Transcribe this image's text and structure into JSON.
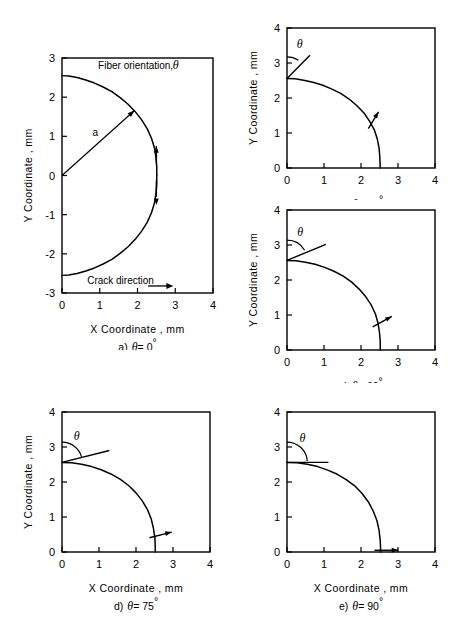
{
  "figure": {
    "kind": "multi-panel-line-chart",
    "background": "#ffffff",
    "line_color": "#000000",
    "panel_count": 5
  },
  "labels": {
    "x_axis": "X Coordinate , mm",
    "y_axis": "Y Coordinate , mm",
    "fiber_orientation": "Fiber orientation,",
    "crack_direction": "Crack direction",
    "radius_symbol": "a",
    "theta_symbol": "θ",
    "degree_symbol": "°"
  },
  "chart_data": [
    {
      "id": "panel-a",
      "type": "line",
      "title": "a) θ = 0°",
      "caption_prefix": "a)",
      "caption_theta": "θ = 0",
      "theta_deg": 0,
      "xlabel": "X Coordinate , mm",
      "ylabel": "Y Coordinate , mm",
      "xlim": [
        0,
        4
      ],
      "ylim": [
        -3,
        3
      ],
      "xticks": [
        0,
        1,
        2,
        3,
        4
      ],
      "xticklabels": [
        "0",
        "1",
        "2",
        "3",
        "4"
      ],
      "yticks": [
        -3,
        -2,
        -1,
        0,
        1,
        2,
        3
      ],
      "yticklabels": [
        "-3",
        "-2",
        "-1",
        "0",
        "1",
        "2",
        "3"
      ],
      "grid": false,
      "legend": false,
      "series": [
        {
          "name": "crack-front-upper",
          "points": [
            [
              0.0,
              2.55
            ],
            [
              0.18,
              2.54
            ],
            [
              0.4,
              2.5
            ],
            [
              0.63,
              2.44
            ],
            [
              0.86,
              2.36
            ],
            [
              1.09,
              2.26
            ],
            [
              1.32,
              2.14
            ],
            [
              1.54,
              1.99
            ],
            [
              1.75,
              1.82
            ],
            [
              1.94,
              1.63
            ],
            [
              2.11,
              1.42
            ],
            [
              2.26,
              1.19
            ],
            [
              2.37,
              0.95
            ],
            [
              2.45,
              0.7
            ],
            [
              2.49,
              0.45
            ],
            [
              2.51,
              0.22
            ],
            [
              2.51,
              0.0
            ]
          ]
        },
        {
          "name": "crack-front-lower",
          "points": [
            [
              2.51,
              0.0
            ],
            [
              2.51,
              -0.22
            ],
            [
              2.49,
              -0.45
            ],
            [
              2.45,
              -0.7
            ],
            [
              2.37,
              -0.95
            ],
            [
              2.26,
              -1.19
            ],
            [
              2.11,
              -1.42
            ],
            [
              1.94,
              -1.63
            ],
            [
              1.75,
              -1.82
            ],
            [
              1.54,
              -1.99
            ],
            [
              1.32,
              -2.14
            ],
            [
              1.09,
              -2.26
            ],
            [
              0.86,
              -2.36
            ],
            [
              0.63,
              -2.44
            ],
            [
              0.4,
              -2.5
            ],
            [
              0.18,
              -2.54
            ],
            [
              0.0,
              -2.55
            ]
          ]
        }
      ],
      "annotations": {
        "title_text": "Fiber orientation,",
        "title_theta": "θ",
        "title_at": [
          1.95,
          2.72
        ],
        "radius_arrow": {
          "from": [
            0.0,
            0.0
          ],
          "to": [
            1.92,
            1.66
          ],
          "label": "a",
          "label_at": [
            0.88,
            1.02
          ]
        },
        "crack_dir_text": "Crack direction",
        "crack_dir_at": [
          1.55,
          -2.78
        ],
        "crack_dir_arrow": {
          "from": [
            2.28,
            -2.82
          ],
          "to": [
            2.95,
            -2.82
          ]
        },
        "fiber_ticks": [
          {
            "at": [
              2.5,
              0.44
            ],
            "angle_deg": 0,
            "length": 0.62,
            "arrow": "up"
          },
          {
            "at": [
              2.5,
              -0.44
            ],
            "angle_deg": 0,
            "length": 0.62,
            "arrow": "down"
          }
        ]
      }
    },
    {
      "id": "panel-b",
      "type": "line",
      "title": "b) θ = 30°",
      "caption_prefix": "b)",
      "caption_theta": "θ = 30",
      "theta_deg": 30,
      "xlabel": "",
      "ylabel": "Y Coordinate , mm",
      "xlim": [
        0,
        4
      ],
      "ylim": [
        0,
        4
      ],
      "xticks": [
        0,
        1,
        2,
        3,
        4
      ],
      "xticklabels": [
        "0",
        "1",
        "2",
        "3",
        "4"
      ],
      "yticks": [
        0,
        1,
        2,
        3,
        4
      ],
      "yticklabels": [
        "0",
        "1",
        "2",
        "3",
        "4"
      ],
      "grid": false,
      "legend": false,
      "series": [
        {
          "name": "crack-front",
          "points": [
            [
              0.0,
              2.56
            ],
            [
              0.22,
              2.55
            ],
            [
              0.45,
              2.51
            ],
            [
              0.7,
              2.45
            ],
            [
              0.95,
              2.37
            ],
            [
              1.2,
              2.26
            ],
            [
              1.45,
              2.13
            ],
            [
              1.68,
              1.97
            ],
            [
              1.89,
              1.78
            ],
            [
              2.08,
              1.57
            ],
            [
              2.23,
              1.34
            ],
            [
              2.36,
              1.09
            ],
            [
              2.44,
              0.83
            ],
            [
              2.49,
              0.56
            ],
            [
              2.51,
              0.28
            ],
            [
              2.52,
              0.0
            ]
          ]
        }
      ],
      "annotations": {
        "theta_label": "θ",
        "theta_label_at": [
          0.34,
          3.42
        ],
        "theta_arc": {
          "center": [
            0.0,
            2.56
          ],
          "radius": 0.58,
          "start_deg": 90,
          "end_deg": 58
        },
        "theta_ray": {
          "from": [
            0.0,
            2.56
          ],
          "to": [
            0.62,
            3.22
          ]
        },
        "fiber_ticks": [
          {
            "at": [
              2.27,
              1.25
            ],
            "angle_deg": 30,
            "length": 0.82,
            "arrow": "tip"
          }
        ]
      }
    },
    {
      "id": "panel-c",
      "type": "line",
      "title": "c) θ = 60°",
      "caption_prefix": "c)",
      "caption_theta": "θ = 60",
      "theta_deg": 60,
      "xlabel": "",
      "ylabel": "Y Coordinate , mm",
      "xlim": [
        0,
        4
      ],
      "ylim": [
        0,
        4
      ],
      "xticks": [
        0,
        1,
        2,
        3,
        4
      ],
      "xticklabels": [
        "0",
        "1",
        "2",
        "3",
        "4"
      ],
      "yticks": [
        0,
        1,
        2,
        3,
        4
      ],
      "yticklabels": [
        "0",
        "1",
        "2",
        "3",
        "4"
      ],
      "grid": false,
      "legend": false,
      "series": [
        {
          "name": "crack-front",
          "points": [
            [
              0.0,
              2.56
            ],
            [
              0.24,
              2.55
            ],
            [
              0.5,
              2.51
            ],
            [
              0.76,
              2.45
            ],
            [
              1.02,
              2.36
            ],
            [
              1.27,
              2.25
            ],
            [
              1.52,
              2.11
            ],
            [
              1.75,
              1.94
            ],
            [
              1.95,
              1.74
            ],
            [
              2.13,
              1.52
            ],
            [
              2.28,
              1.28
            ],
            [
              2.39,
              1.03
            ],
            [
              2.46,
              0.77
            ],
            [
              2.5,
              0.5
            ],
            [
              2.52,
              0.24
            ],
            [
              2.52,
              0.0
            ]
          ]
        }
      ],
      "annotations": {
        "theta_label": "θ",
        "theta_label_at": [
          0.36,
          3.26
        ],
        "theta_arc": {
          "center": [
            0.0,
            2.56
          ],
          "radius": 0.55,
          "start_deg": 90,
          "end_deg": 30
        },
        "theta_ray": {
          "from": [
            0.0,
            2.56
          ],
          "to": [
            1.05,
            3.02
          ]
        },
        "fiber_ticks": [
          {
            "at": [
              2.45,
              0.74
            ],
            "angle_deg": 60,
            "length": 0.88,
            "arrow": "tip"
          }
        ]
      }
    },
    {
      "id": "panel-d",
      "type": "line",
      "title": "d) θ = 75°",
      "caption_prefix": "d)",
      "caption_theta": "θ = 75",
      "theta_deg": 75,
      "xlabel": "X Coordinate , mm",
      "ylabel": "Y Coordinate , mm",
      "xlim": [
        0,
        4
      ],
      "ylim": [
        0,
        4
      ],
      "xticks": [
        0,
        1,
        2,
        3,
        4
      ],
      "xticklabels": [
        "0",
        "1",
        "2",
        "3",
        "4"
      ],
      "yticks": [
        0,
        1,
        2,
        3,
        4
      ],
      "yticklabels": [
        "0",
        "1",
        "2",
        "3",
        "4"
      ],
      "grid": false,
      "legend": false,
      "series": [
        {
          "name": "crack-front",
          "points": [
            [
              0.0,
              2.56
            ],
            [
              0.26,
              2.55
            ],
            [
              0.53,
              2.51
            ],
            [
              0.8,
              2.44
            ],
            [
              1.06,
              2.35
            ],
            [
              1.32,
              2.23
            ],
            [
              1.57,
              2.08
            ],
            [
              1.8,
              1.9
            ],
            [
              2.0,
              1.69
            ],
            [
              2.17,
              1.46
            ],
            [
              2.31,
              1.21
            ],
            [
              2.41,
              0.95
            ],
            [
              2.47,
              0.68
            ],
            [
              2.51,
              0.41
            ],
            [
              2.52,
              0.16
            ],
            [
              2.52,
              0.0
            ]
          ]
        }
      ],
      "annotations": {
        "theta_label": "θ",
        "theta_label_at": [
          0.4,
          3.2
        ],
        "theta_arc": {
          "center": [
            0.0,
            2.56
          ],
          "radius": 0.55,
          "start_deg": 90,
          "end_deg": 16
        },
        "theta_ray": {
          "from": [
            0.0,
            2.56
          ],
          "to": [
            1.28,
            2.9
          ]
        },
        "fiber_ticks": [
          {
            "at": [
              2.52,
              0.45
            ],
            "angle_deg": 75,
            "length": 0.92,
            "arrow": "tip"
          }
        ]
      }
    },
    {
      "id": "panel-e",
      "type": "line",
      "title": "e) θ = 90°",
      "caption_prefix": "e)",
      "caption_theta": "θ = 90",
      "theta_deg": 90,
      "xlabel": "X Coordinate , mm",
      "ylabel": "",
      "xlim": [
        0,
        4
      ],
      "ylim": [
        0,
        4
      ],
      "xticks": [
        0,
        1,
        2,
        3,
        4
      ],
      "xticklabels": [
        "0",
        "1",
        "2",
        "3",
        "4"
      ],
      "yticks": [
        0,
        1,
        2,
        3,
        4
      ],
      "yticklabels": [
        "0",
        "1",
        "2",
        "3",
        "4"
      ],
      "grid": false,
      "legend": false,
      "series": [
        {
          "name": "crack-front",
          "points": [
            [
              0.0,
              2.56
            ],
            [
              0.27,
              2.55
            ],
            [
              0.55,
              2.51
            ],
            [
              0.83,
              2.44
            ],
            [
              1.1,
              2.34
            ],
            [
              1.36,
              2.22
            ],
            [
              1.6,
              2.07
            ],
            [
              1.83,
              1.89
            ],
            [
              2.03,
              1.67
            ],
            [
              2.2,
              1.43
            ],
            [
              2.33,
              1.17
            ],
            [
              2.43,
              0.9
            ],
            [
              2.49,
              0.61
            ],
            [
              2.52,
              0.32
            ],
            [
              2.53,
              0.08
            ],
            [
              2.53,
              0.0
            ]
          ]
        }
      ],
      "annotations": {
        "theta_label": "θ",
        "theta_label_at": [
          0.42,
          3.14
        ],
        "theta_arc": {
          "center": [
            0.0,
            2.56
          ],
          "radius": 0.55,
          "start_deg": 90,
          "end_deg": 4
        },
        "theta_ray": {
          "from": [
            0.0,
            2.56
          ],
          "to": [
            1.12,
            2.56
          ]
        },
        "fiber_ticks": [
          {
            "at": [
              2.53,
              0.05
            ],
            "angle_deg": 90,
            "length": 0.95,
            "arrow": "tip"
          }
        ]
      }
    }
  ],
  "panel_layout": [
    {
      "id": "panel-a",
      "left": 0,
      "top": 0,
      "width": 240,
      "height": 350,
      "plot": {
        "x": 62,
        "y": 58,
        "w": 151,
        "h": 235
      }
    },
    {
      "id": "panel-b",
      "left": 240,
      "top": 0,
      "width": 220,
      "height": 200,
      "plot": {
        "x": 47,
        "y": 28,
        "w": 148,
        "h": 140
      }
    },
    {
      "id": "panel-c",
      "left": 240,
      "top": 178,
      "width": 220,
      "height": 205,
      "plot": {
        "x": 47,
        "y": 32,
        "w": 148,
        "h": 140
      }
    },
    {
      "id": "panel-d",
      "left": 0,
      "top": 390,
      "width": 240,
      "height": 243,
      "plot": {
        "x": 62,
        "y": 22,
        "w": 148,
        "h": 140
      }
    },
    {
      "id": "panel-e",
      "left": 240,
      "top": 390,
      "width": 220,
      "height": 243,
      "plot": {
        "x": 47,
        "y": 22,
        "w": 148,
        "h": 140
      }
    }
  ]
}
